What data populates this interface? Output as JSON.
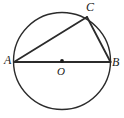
{
  "figure": {
    "type": "geometry-diagram",
    "background_color": "#ffffff",
    "stroke_color": "#2b2b2b",
    "label_color": "#1a1a1a",
    "canvas": {
      "width": 124,
      "height": 118
    }
  },
  "circle": {
    "name": "circle-O",
    "center": {
      "x": 62,
      "y": 61
    },
    "radius": 48.5,
    "stroke_width": 1.4
  },
  "points": {
    "A": {
      "label": "A",
      "x": 14,
      "y": 62
    },
    "B": {
      "label": "B",
      "x": 110.5,
      "y": 62
    },
    "C": {
      "label": "C",
      "x": 87,
      "y": 17
    },
    "O": {
      "label": "O",
      "x": 62,
      "y": 61
    }
  },
  "segments": [
    {
      "name": "segment-AB",
      "from": "A",
      "to": "B",
      "kind": "diameter",
      "stroke_width": 2.0
    },
    {
      "name": "segment-AC",
      "from": "A",
      "to": "C",
      "kind": "chord",
      "stroke_width": 1.8
    },
    {
      "name": "segment-CB",
      "from": "C",
      "to": "B",
      "kind": "chord",
      "stroke_width": 1.8
    }
  ],
  "center_marker": {
    "name": "center-dot",
    "x": 62,
    "y": 61,
    "radius": 1.9
  }
}
